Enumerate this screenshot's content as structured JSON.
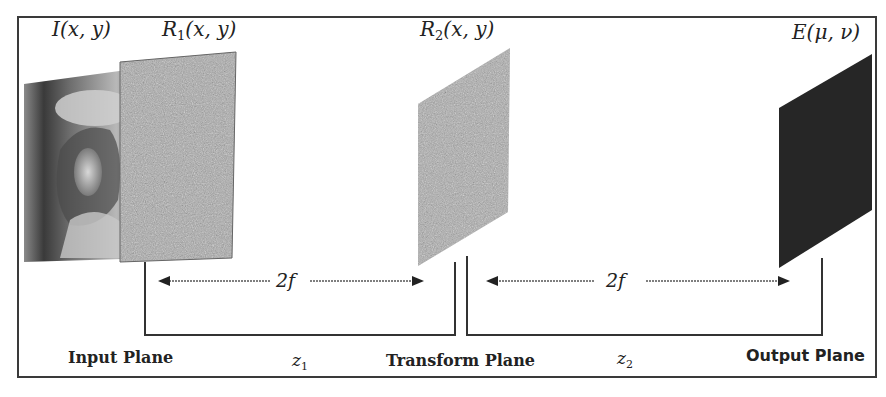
{
  "figure": {
    "type": "optical system schematic (double random phase encoding, 4f setup)",
    "colors": {
      "frame": "#3a3a3a",
      "line": "#333333",
      "random_mask": "#a8a8a8",
      "output_plane": "#262626",
      "text": "#222222"
    }
  },
  "labels": {
    "input_image": {
      "symbol": "I",
      "args": "(x, y)"
    },
    "phase_mask_1": {
      "symbol": "R",
      "sub": "1",
      "args": "(x, y)"
    },
    "phase_mask_2": {
      "symbol": "R",
      "sub": "2",
      "args": "(x, y)"
    },
    "output": {
      "symbol": "E",
      "args": "(μ, ν)"
    }
  },
  "distances": {
    "first": "2f",
    "second": "2f"
  },
  "axes": {
    "z1": {
      "symbol": "z",
      "sub": "1"
    },
    "z2": {
      "symbol": "z",
      "sub": "2"
    }
  },
  "planes": {
    "input": "Input Plane",
    "transform": "Transform Plane",
    "output": "Output Plane"
  }
}
